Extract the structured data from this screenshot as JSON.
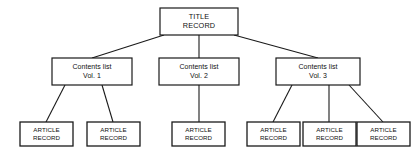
{
  "diagram": {
    "type": "tree-hierarchy",
    "background_color": "#ffffff",
    "line_color": "#1a1a1a",
    "text_color": "#111111",
    "levels": 3,
    "root": {
      "id": "title-record",
      "lines": [
        "TITLE",
        "RECORD"
      ],
      "line1": "TITLE",
      "line2": "RECORD",
      "box": {
        "x": 160,
        "y": 8,
        "w": 78,
        "h": 27
      }
    },
    "contents_lists": [
      {
        "id": "contents-list-vol-1",
        "line1": "Contents list",
        "line2": "Vol. 1",
        "box": {
          "x": 52,
          "y": 58,
          "w": 80,
          "h": 27
        }
      },
      {
        "id": "contents-list-vol-2",
        "line1": "Contents list",
        "line2": "Vol. 2",
        "box": {
          "x": 159,
          "y": 58,
          "w": 80,
          "h": 27
        }
      },
      {
        "id": "contents-list-vol-3",
        "line1": "Contents list",
        "line2": "Vol. 3",
        "box": {
          "x": 276,
          "y": 58,
          "w": 84,
          "h": 27
        }
      }
    ],
    "article_records": [
      {
        "id": "article-record-1",
        "parent": "contents-list-vol-1",
        "line1": "ARTICLE",
        "line2": "RECORD",
        "box": {
          "x": 20,
          "y": 122,
          "w": 53,
          "h": 24
        }
      },
      {
        "id": "article-record-2",
        "parent": "contents-list-vol-1",
        "line1": "ARTICLE",
        "line2": "RECORD",
        "box": {
          "x": 87,
          "y": 122,
          "w": 53,
          "h": 24
        }
      },
      {
        "id": "article-record-3",
        "parent": "contents-list-vol-2",
        "line1": "ARTICLE",
        "line2": "RECORD",
        "box": {
          "x": 172,
          "y": 122,
          "w": 53,
          "h": 24
        }
      },
      {
        "id": "article-record-4",
        "parent": "contents-list-vol-3",
        "line1": "ARTICLE",
        "line2": "RECORD",
        "box": {
          "x": 247,
          "y": 122,
          "w": 53,
          "h": 24
        }
      },
      {
        "id": "article-record-5",
        "parent": "contents-list-vol-3",
        "line1": "ARTICLE",
        "line2": "RECORD",
        "box": {
          "x": 303,
          "y": 122,
          "w": 53,
          "h": 24
        }
      },
      {
        "id": "article-record-6",
        "parent": "contents-list-vol-3",
        "line1": "ARTICLE",
        "line2": "RECORD",
        "box": {
          "x": 357,
          "y": 122,
          "w": 53,
          "h": 24
        }
      }
    ],
    "connectors": [
      {
        "id": "root-to-vol-1",
        "from": "title-record",
        "to": "contents-list-vol-1",
        "path": "M 164,35 L 92,58"
      },
      {
        "id": "root-to-vol-2",
        "from": "title-record",
        "to": "contents-list-vol-2",
        "path": "M 199,35 L 199,58"
      },
      {
        "id": "root-to-vol-3",
        "from": "title-record",
        "to": "contents-list-vol-3",
        "path": "M 234,35 L 318,58"
      },
      {
        "id": "vol-1-to-article-1",
        "from": "contents-list-vol-1",
        "to": "article-record-1",
        "path": "M 65,85 L 46,122"
      },
      {
        "id": "vol-1-to-article-2",
        "from": "contents-list-vol-1",
        "to": "article-record-2",
        "path": "M 102,85 L 113,122"
      },
      {
        "id": "vol-2-to-article-3",
        "from": "contents-list-vol-2",
        "to": "article-record-3",
        "path": "M 199,85 L 199,122"
      },
      {
        "id": "vol-3-to-article-4",
        "from": "contents-list-vol-3",
        "to": "article-record-4",
        "path": "M 292,85 L 273,122"
      },
      {
        "id": "vol-3-to-article-5",
        "from": "contents-list-vol-3",
        "to": "article-record-5",
        "path": "M 329,85 L 329,122"
      },
      {
        "id": "vol-3-to-article-6",
        "from": "contents-list-vol-3",
        "to": "article-record-6",
        "path": "M 349,85 L 383,122"
      }
    ]
  }
}
